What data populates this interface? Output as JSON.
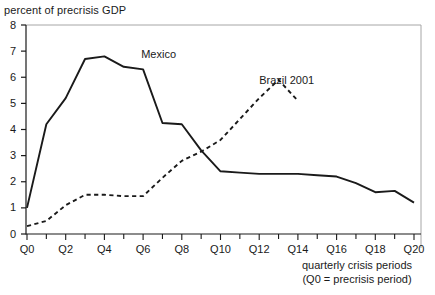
{
  "chart_data": {
    "type": "line",
    "title": "",
    "ylabel": "percent of precrisis GDP",
    "xlabel": "quarterly crisis periods",
    "xlabel_note": "(Q0 = precrisis period)",
    "ylim": [
      0,
      8
    ],
    "ytick_labels": [
      "0",
      "1",
      "2",
      "3",
      "4",
      "5",
      "6",
      "7",
      "8"
    ],
    "ytick_values": [
      0,
      1,
      2,
      3,
      4,
      5,
      6,
      7,
      8
    ],
    "xlim": [
      0,
      20
    ],
    "xtick_labels": [
      "Q0",
      "Q2",
      "Q4",
      "Q6",
      "Q8",
      "Q10",
      "Q12",
      "Q14",
      "Q16",
      "Q18",
      "Q20"
    ],
    "xtick_values": [
      0,
      2,
      4,
      6,
      8,
      10,
      12,
      14,
      16,
      18,
      20
    ],
    "minor_xticks": [
      1,
      3,
      5,
      7,
      9,
      11,
      13,
      15,
      17,
      19
    ],
    "grid": false,
    "legend_position": "inline-annotation",
    "x": [
      0,
      1,
      2,
      3,
      4,
      5,
      6,
      7,
      8,
      9,
      10,
      11,
      12,
      13,
      14,
      15,
      16,
      17,
      18,
      19,
      20
    ],
    "series": [
      {
        "name": "Mexico",
        "style": "solid",
        "color": "#1a1a1a",
        "values": [
          1.0,
          4.2,
          5.2,
          6.7,
          6.8,
          6.4,
          6.3,
          4.25,
          4.2,
          3.2,
          2.4,
          2.35,
          2.3,
          2.3,
          2.3,
          2.25,
          2.2,
          1.95,
          1.6,
          1.65,
          1.2
        ]
      },
      {
        "name": "Brazil 2001",
        "style": "dashed",
        "color": "#1a1a1a",
        "values": [
          0.3,
          0.5,
          1.1,
          1.5,
          1.5,
          1.45,
          1.45,
          2.15,
          2.8,
          3.15,
          3.6,
          4.4,
          5.2,
          5.9,
          5.1,
          null,
          null,
          null,
          null,
          null,
          null
        ]
      }
    ],
    "annotations": [
      {
        "text": "Mexico",
        "x": 5.9,
        "y": 6.85
      },
      {
        "text": "Brazil 2001",
        "x": 12.0,
        "y": 5.85
      }
    ],
    "frame_color": "#a6a6a6",
    "axis_color": "#1a1a1a"
  }
}
